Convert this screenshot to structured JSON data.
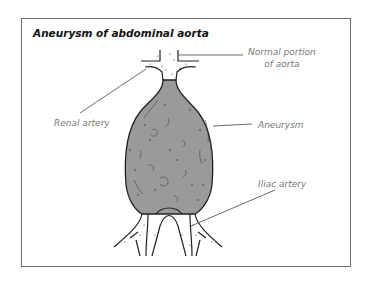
{
  "figure": {
    "title": "Aneurysm of abdominal aorta",
    "labels": {
      "normal_portion_line1": "Normal portion",
      "normal_portion_line2": "of aorta",
      "renal_artery": "Renal artery",
      "aneurysm": "Aneurysm",
      "iliac_artery": "Iliac artery"
    },
    "colors": {
      "aneurysm_fill": "#9a9a9a",
      "vessel_fill": "#ffffff",
      "outline": "#222222",
      "leader_line": "#444444",
      "label_text": "#777777",
      "frame_border": "#6e6e6e"
    }
  }
}
